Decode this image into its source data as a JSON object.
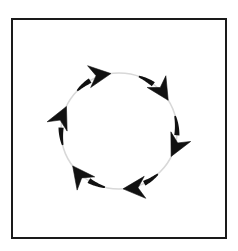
{
  "figure": {
    "title": "Circular motion arrow diagram",
    "background_color": "#ffffff",
    "frame": {
      "name": "outer-frame",
      "x": 12,
      "y": 19,
      "width": 214,
      "height": 219,
      "stroke_color": "#1a1a1a",
      "stroke_width": 2,
      "fill_color": "#ffffff"
    },
    "circle": {
      "name": "guide-circle",
      "center_x": 119,
      "center_y": 131,
      "radius": 58,
      "stroke_color": "#d8d8d8",
      "stroke_width": 1.6,
      "fill": "none"
    },
    "arrow_style": {
      "color": "#111111",
      "tail_width": 5.2,
      "head_length": 22,
      "head_half_width": 11,
      "barb_inset": 7,
      "direction": "clockwise",
      "count": 6
    },
    "arrows": [
      {
        "name": "arrow-top",
        "label": "top arrow",
        "start_angle_deg": 290,
        "end_angle_deg": 328,
        "points_toward": "right-down"
      },
      {
        "name": "arrow-upper-right",
        "label": "upper-right arrow",
        "start_angle_deg": 345,
        "end_angle_deg": 26,
        "points_toward": "down-right"
      },
      {
        "name": "arrow-lower-right",
        "label": "lower-right arrow",
        "start_angle_deg": 48,
        "end_angle_deg": 86,
        "points_toward": "down-left"
      },
      {
        "name": "arrow-bottom",
        "label": "bottom arrow",
        "start_angle_deg": 104,
        "end_angle_deg": 143,
        "points_toward": "left-up"
      },
      {
        "name": "arrow-lower-left",
        "label": "lower-left arrow",
        "start_angle_deg": 166,
        "end_angle_deg": 205,
        "points_toward": "up"
      },
      {
        "name": "arrow-upper-left",
        "label": "upper-left arrow",
        "start_angle_deg": 224,
        "end_angle_deg": 262,
        "points_toward": "up-right"
      }
    ]
  }
}
